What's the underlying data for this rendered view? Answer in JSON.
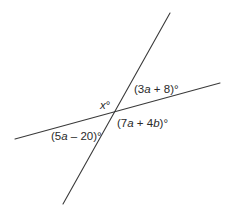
{
  "diagram": {
    "line_color": "#3a3a3a",
    "text_color": "#2a2a2a",
    "lines": [
      {
        "name": "steep-line",
        "x1": 170,
        "y1": 13,
        "x2": 63,
        "y2": 204
      },
      {
        "name": "shallow-line",
        "x1": 15,
        "y1": 139,
        "x2": 220,
        "y2": 83
      }
    ],
    "intersection": {
      "x": 114,
      "y": 113
    },
    "angles": [
      {
        "name": "angle-x",
        "parts": [
          "",
          "x",
          "°"
        ],
        "position": "upper-left"
      },
      {
        "name": "angle-3a-plus-8",
        "parts": [
          "(3",
          "a",
          " + 8)°"
        ],
        "position": "upper-right"
      },
      {
        "name": "angle-7a-plus-4b",
        "parts": [
          "(7",
          "a",
          " + 4",
          "b",
          ")°"
        ],
        "position": "lower-right"
      },
      {
        "name": "angle-5a-minus-20",
        "parts": [
          "(5",
          "a",
          " – 20)°"
        ],
        "position": "lower-left"
      }
    ]
  }
}
